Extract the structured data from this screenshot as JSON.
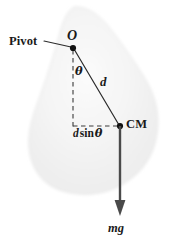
{
  "figure": {
    "background_color": "#ffffff",
    "body": {
      "name": "rigid-body-blob",
      "fill_color": "#f2f2f2",
      "edge_color": "#e6e6e6",
      "description": "irregular light gray teardrop-shaped rigid body"
    },
    "labels": {
      "pivot": "Pivot",
      "origin": "O",
      "angle": "θ",
      "distance": "d",
      "horizontal_offset_d": "d",
      "horizontal_offset_sin": "sin",
      "horizontal_offset_theta": "θ",
      "center_of_mass": "CM",
      "weight_force": "mg"
    },
    "geometry": {
      "pivot_point": {
        "x": 73,
        "y": 48
      },
      "cm_point": {
        "x": 120,
        "y": 126
      },
      "vertical_dashed_end": {
        "x": 73,
        "y": 128
      },
      "arrow_tip": {
        "x": 120,
        "y": 216
      },
      "leader_line_start": {
        "x": 44,
        "y": 41
      },
      "leader_line_end": {
        "x": 71,
        "y": 47
      }
    },
    "colors": {
      "stroke": "#2b2b2b",
      "dashed_stroke": "#3a3a3a",
      "dot": "#111111",
      "arrow": "#4a4a4a",
      "text": "#1a1a1a"
    }
  }
}
